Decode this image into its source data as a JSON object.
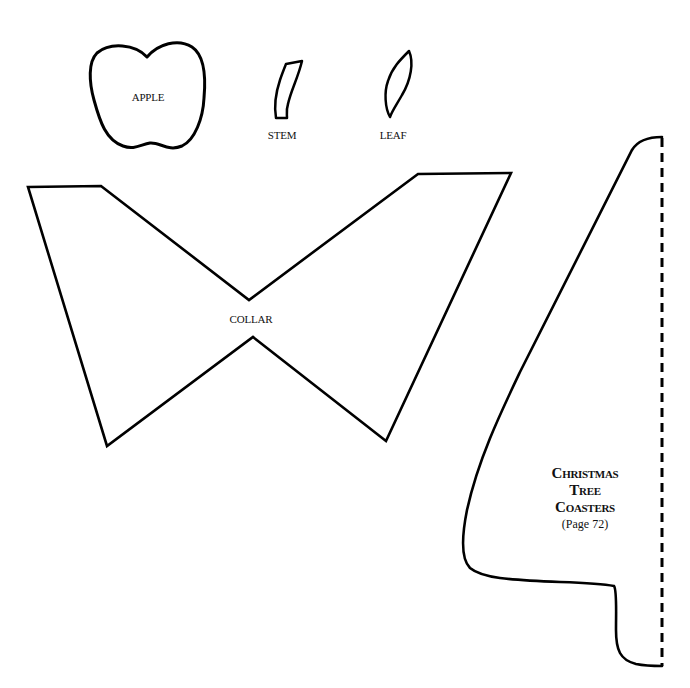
{
  "pattern_sheet": {
    "pieces": {
      "apple": {
        "label": "APPLE"
      },
      "stem": {
        "label": "STEM"
      },
      "leaf": {
        "label": "LEAF"
      },
      "collar": {
        "label": "COLLAR"
      },
      "tree": {
        "title_lines": [
          "Christmas",
          "Tree",
          "Coasters"
        ],
        "page_ref": "(Page 72)",
        "fold_line": "dashed"
      }
    },
    "colors": {
      "line": "#000000",
      "background": "#ffffff"
    }
  }
}
